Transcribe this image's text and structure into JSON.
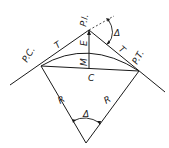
{
  "diagram": {
    "points": {
      "pc": {
        "label": "P.C.",
        "x": 41,
        "y": 66
      },
      "pi": {
        "label": "P.I.",
        "x": 89,
        "y": 30
      },
      "pt": {
        "label": "P.T.",
        "x": 139,
        "y": 71
      },
      "center": {
        "x": 86,
        "y": 143
      }
    },
    "labels": {
      "pc": "P.C.",
      "pi": "P.I.",
      "pt": "P.T.",
      "tangent_left": "T",
      "tangent_right": "T",
      "external": "E",
      "middle_ordinate": "M",
      "chord": "C",
      "radius_left": "R",
      "radius_right": "R",
      "delta_top": "Δ",
      "delta_center": "Δ"
    },
    "colors": {
      "line": "#1a1a1a",
      "background": "#ffffff"
    }
  }
}
